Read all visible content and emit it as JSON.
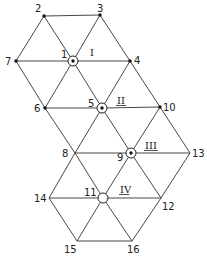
{
  "diagram": {
    "type": "triangular-lattice-graph",
    "nodes": [
      {
        "id": "1",
        "label": "1",
        "x": 73,
        "y": 61,
        "style": "ring-dot",
        "lx": 61,
        "ly": 58
      },
      {
        "id": "2",
        "label": "2",
        "x": 44,
        "y": 16,
        "style": "dot",
        "lx": 35,
        "ly": 12
      },
      {
        "id": "3",
        "label": "3",
        "x": 100,
        "y": 15,
        "style": "dot",
        "lx": 97,
        "ly": 12
      },
      {
        "id": "4",
        "label": "4",
        "x": 130,
        "y": 61,
        "style": "dot",
        "lx": 134,
        "ly": 64
      },
      {
        "id": "5",
        "label": "5",
        "x": 102,
        "y": 108,
        "style": "ring-dot",
        "lx": 88,
        "ly": 107
      },
      {
        "id": "6",
        "label": "6",
        "x": 45,
        "y": 108,
        "style": "dot",
        "lx": 34,
        "ly": 112
      },
      {
        "id": "7",
        "label": "7",
        "x": 16,
        "y": 61,
        "style": "dot",
        "lx": 5,
        "ly": 65
      },
      {
        "id": "8",
        "label": "8",
        "x": 75,
        "y": 153,
        "style": "none",
        "lx": 62,
        "ly": 157
      },
      {
        "id": "9",
        "label": "9",
        "x": 131,
        "y": 153,
        "style": "ring-dot",
        "lx": 117,
        "ly": 161
      },
      {
        "id": "10",
        "label": "10",
        "x": 160,
        "y": 107,
        "style": "dot",
        "lx": 163,
        "ly": 111
      },
      {
        "id": "11",
        "label": "11",
        "x": 103,
        "y": 198,
        "style": "ring",
        "lx": 84,
        "ly": 196
      },
      {
        "id": "12",
        "label": "12",
        "x": 161,
        "y": 198,
        "style": "none",
        "lx": 162,
        "ly": 210
      },
      {
        "id": "13",
        "label": "13",
        "x": 190,
        "y": 153,
        "style": "none",
        "lx": 192,
        "ly": 157
      },
      {
        "id": "14",
        "label": "14",
        "x": 49,
        "y": 198,
        "style": "none",
        "lx": 34,
        "ly": 202
      },
      {
        "id": "15",
        "label": "15",
        "x": 77,
        "y": 241,
        "style": "none",
        "lx": 64,
        "ly": 253
      },
      {
        "id": "16",
        "label": "16",
        "x": 132,
        "y": 241,
        "style": "none",
        "lx": 127,
        "ly": 253
      }
    ],
    "edges": [
      [
        "2",
        "3"
      ],
      [
        "2",
        "7"
      ],
      [
        "2",
        "1"
      ],
      [
        "3",
        "1"
      ],
      [
        "3",
        "4"
      ],
      [
        "7",
        "1"
      ],
      [
        "1",
        "4"
      ],
      [
        "7",
        "6"
      ],
      [
        "1",
        "6"
      ],
      [
        "1",
        "5"
      ],
      [
        "4",
        "5"
      ],
      [
        "4",
        "10"
      ],
      [
        "6",
        "5"
      ],
      [
        "5",
        "10"
      ],
      [
        "6",
        "8"
      ],
      [
        "5",
        "8"
      ],
      [
        "5",
        "9"
      ],
      [
        "10",
        "9"
      ],
      [
        "10",
        "13"
      ],
      [
        "8",
        "9"
      ],
      [
        "9",
        "13"
      ],
      [
        "8",
        "14"
      ],
      [
        "8",
        "11"
      ],
      [
        "9",
        "11"
      ],
      [
        "9",
        "12"
      ],
      [
        "13",
        "12"
      ],
      [
        "14",
        "11"
      ],
      [
        "11",
        "12"
      ],
      [
        "14",
        "15"
      ],
      [
        "11",
        "15"
      ],
      [
        "11",
        "16"
      ],
      [
        "12",
        "16"
      ],
      [
        "15",
        "16"
      ]
    ],
    "regions": [
      {
        "label": "I",
        "x": 90,
        "y": 56,
        "underline": false
      },
      {
        "label": "II",
        "x": 117,
        "y": 104,
        "underline": true
      },
      {
        "label": "III",
        "x": 145,
        "y": 149,
        "underline": true
      },
      {
        "label": "IV",
        "x": 120,
        "y": 193,
        "underline": true
      }
    ]
  }
}
